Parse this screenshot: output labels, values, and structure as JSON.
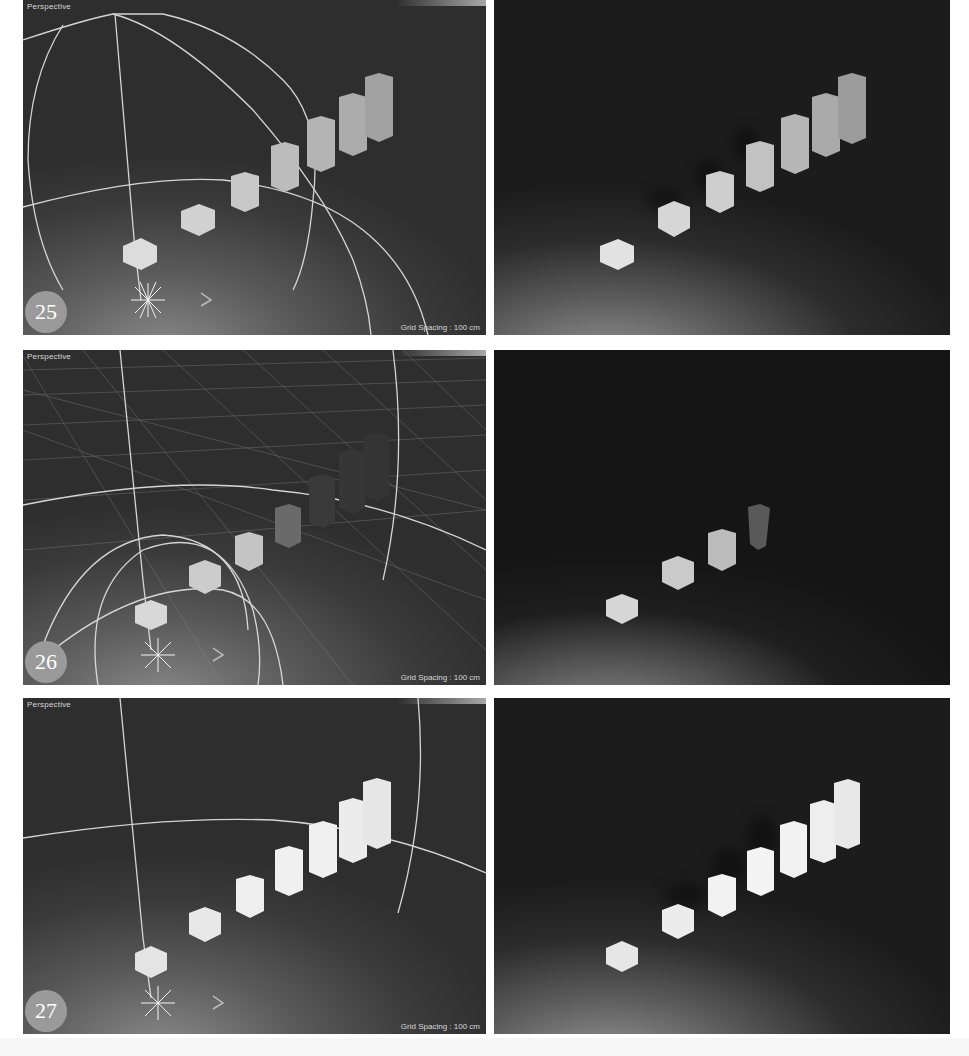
{
  "figure": {
    "steps": [
      {
        "number": "25",
        "viewport": {
          "label": "Perspective",
          "grid_spacing": "Grid Spacing : 100 cm",
          "grid_visible": false
        },
        "render": {
          "description": "Rendered scene: seven ascending boxes lit, soft shadows"
        }
      },
      {
        "number": "26",
        "viewport": {
          "label": "Perspective",
          "grid_spacing": "Grid Spacing : 100 cm",
          "grid_visible": true
        },
        "render": {
          "description": "Rendered scene: first boxes lit, far boxes fade into darkness"
        }
      },
      {
        "number": "27",
        "viewport": {
          "label": "Perspective",
          "grid_spacing": "Grid Spacing : 100 cm",
          "grid_visible": false
        },
        "render": {
          "description": "Rendered scene: all seven boxes brightly lit with shadows"
        }
      }
    ],
    "colors": {
      "background": "#ffffff",
      "viewport_bg": "#3a3a3a",
      "render_bg": "#1c1c1c",
      "badge": "#9a9a9a",
      "gizmo_lines": "#e6e6e6",
      "box_light": "#e8e8e8"
    }
  }
}
